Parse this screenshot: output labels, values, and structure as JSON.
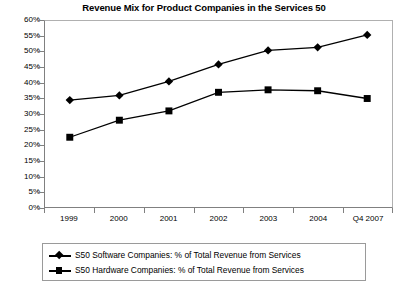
{
  "chart_data": {
    "type": "line",
    "title": "Revenue Mix for Product Companies in the Services 50",
    "xlabel": "",
    "ylabel": "",
    "categories": [
      "1999",
      "2000",
      "2001",
      "2002",
      "2003",
      "2004",
      "Q4 2007"
    ],
    "ylim": [
      0,
      60
    ],
    "ytick_step": 5,
    "ytick_labels": [
      "0%",
      "5%",
      "10%",
      "15%",
      "20%",
      "25%",
      "30%",
      "35%",
      "40%",
      "45%",
      "50%",
      "55%",
      "60%"
    ],
    "grid": false,
    "legend_position": "bottom",
    "series": [
      {
        "name": "S50 Software Companies: % of Total Revenue from Services",
        "marker": "diamond",
        "color": "#000000",
        "values": [
          34.5,
          36.0,
          40.5,
          46.0,
          50.5,
          51.5,
          55.5
        ]
      },
      {
        "name": "S50 Hardware Companies: % of Total Revenue from Services",
        "marker": "square",
        "color": "#000000",
        "values": [
          22.5,
          28.0,
          31.0,
          37.0,
          37.8,
          37.5,
          35.0
        ]
      }
    ]
  }
}
